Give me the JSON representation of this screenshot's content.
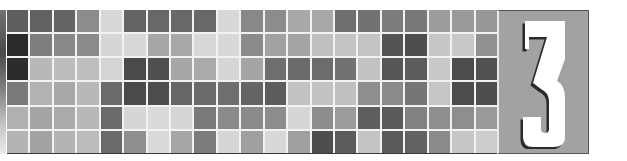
{
  "chapter": {
    "number": "3",
    "panel_color": "#a2a2a2",
    "numeral_color": "#ffffff",
    "numeral_shadow_color": "#2b2b2b"
  },
  "mosaic": {
    "rows": 6,
    "columns": 21,
    "gap_color": "#f2f2f2",
    "cells": [
      [
        "#5e5e5e",
        "#626262",
        "#646464",
        "#8c8c8c",
        "#d8d8d8",
        "#646464",
        "#686868",
        "#686868",
        "#686868",
        "#d8d8d8",
        "#888888",
        "#8c8c8c",
        "#a8a8a8",
        "#a8a8a8",
        "#6e6e6e",
        "#727272",
        "#7c7c7c",
        "#787878",
        "#9c9c9c",
        "#9a9a9a",
        "#989898"
      ],
      [
        "#2a2a2a",
        "#7e7e7e",
        "#888888",
        "#8a8a8a",
        "#d6d6d6",
        "#d8d8d8",
        "#a6a6a6",
        "#a8a8a8",
        "#d8d8d8",
        "#d8d8d8",
        "#8a8a8a",
        "#a2a2a2",
        "#a4a4a4",
        "#c0c0c0",
        "#c4c4c4",
        "#c4c4c4",
        "#545454",
        "#4e4e4e",
        "#c6c6c6",
        "#c8c8c8",
        "#909090"
      ],
      [
        "#2c2c2c",
        "#b8b8b8",
        "#bcbcbc",
        "#bebebe",
        "#d4d4d4",
        "#4a4a4a",
        "#505050",
        "#a6a6a6",
        "#aaaaaa",
        "#d6d6d6",
        "#a4a4a4",
        "#6e6e6e",
        "#6a6a6a",
        "#6c6c6c",
        "#727272",
        "#c2c2c2",
        "#565656",
        "#5c5c5c",
        "#c8c8c8",
        "#4c4c4c",
        "#525252"
      ],
      [
        "#7a7a7a",
        "#b2b2b2",
        "#a8a8a8",
        "#b8b8b8",
        "#6a6a6a",
        "#4a4a4a",
        "#4c4c4c",
        "#666666",
        "#6a6a6a",
        "#6e6e6e",
        "#646464",
        "#5c5c5c",
        "#c2c2c2",
        "#c2c2c2",
        "#c0c0c0",
        "#8e8e8e",
        "#8a8a8a",
        "#767676",
        "#c6c6c6",
        "#4c4c4c",
        "#4e4e4e"
      ],
      [
        "#b0b0b0",
        "#a4a4a4",
        "#aaaaaa",
        "#b8b8b8",
        "#6a6a6a",
        "#d6d6d6",
        "#dadada",
        "#d6d6d6",
        "#7a7a7a",
        "#8a8a8a",
        "#8a8a8a",
        "#8c8c8c",
        "#d6d6d6",
        "#8c8c8c",
        "#9c9c9c",
        "#5e5e5e",
        "#5a5a5a",
        "#828282",
        "#8e8e8e",
        "#8e8e8e",
        "#9a9a9a"
      ],
      [
        "#b4b4b4",
        "#a2a2a2",
        "#b4b4b4",
        "#bcbcbc",
        "#6a6a6a",
        "#8e8e8e",
        "#dadada",
        "#a6a6a6",
        "#7c7c7c",
        "#d6d6d6",
        "#a0a0a0",
        "#d8d8d8",
        "#a0a0a0",
        "#4e4e4e",
        "#5c5c5c",
        "#c4c4c4",
        "#5a5a5a",
        "#626262",
        "#8a8a8a",
        "#c6c6c6",
        "#cccccc"
      ]
    ]
  }
}
